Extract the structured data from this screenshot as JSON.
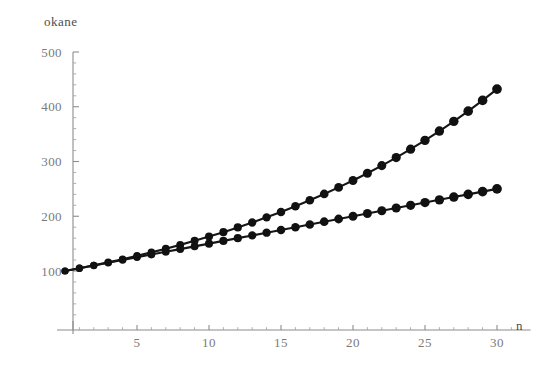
{
  "chart_data": {
    "type": "line",
    "title": "",
    "subtitle": "",
    "xlabel": "n",
    "ylabel": "okane",
    "xlim": [
      0,
      31.5
    ],
    "ylim": [
      0,
      500
    ],
    "grid": false,
    "legend": "none",
    "markers": "filled-circle",
    "x": [
      0,
      1,
      2,
      3,
      4,
      5,
      6,
      7,
      8,
      9,
      10,
      11,
      12,
      13,
      14,
      15,
      16,
      17,
      18,
      19,
      20,
      21,
      22,
      23,
      24,
      25,
      26,
      27,
      28,
      29,
      30
    ],
    "x_ticks_major": [
      5,
      10,
      15,
      20,
      25,
      30
    ],
    "x_tick_labels": [
      "5",
      "10",
      "15",
      "20",
      "25",
      "30"
    ],
    "y_ticks_major": [
      100,
      200,
      300,
      400,
      500
    ],
    "y_tick_labels": [
      "100",
      "200",
      "300",
      "400",
      "500"
    ],
    "y_minor_step": 20,
    "x_minor_step": 1,
    "series": [
      {
        "name": "compound",
        "color": "#111111",
        "values": [
          100,
          105,
          110.3,
          115.8,
          121.6,
          127.6,
          134,
          140.7,
          147.7,
          155.1,
          162.9,
          171,
          179.6,
          188.6,
          198,
          207.9,
          218.3,
          229.2,
          240.7,
          252.7,
          265.3,
          278.6,
          292.5,
          307.2,
          322.5,
          338.6,
          355.6,
          373.3,
          392,
          411.6,
          432.2
        ]
      },
      {
        "name": "simple",
        "color": "#111111",
        "values": [
          100,
          105,
          110,
          115,
          120,
          125,
          130,
          135,
          140,
          145,
          150,
          155,
          160,
          165,
          170,
          175,
          180,
          185,
          190,
          195,
          200,
          205,
          210,
          215,
          220,
          225,
          230,
          235,
          240,
          245,
          250
        ]
      }
    ],
    "axis_color": "#8c8c8c",
    "tick_label_color": "#7a7a7a",
    "label_color": "#4d4d4d",
    "background": "#ffffff"
  }
}
